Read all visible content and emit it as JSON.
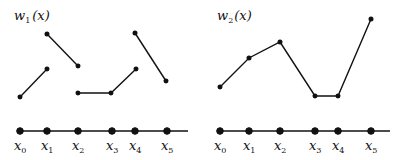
{
  "diagram": {
    "colors": {
      "ink": "#111111",
      "background": "#ffffff"
    },
    "panels": [
      {
        "title": {
          "base": "w",
          "sub": "1",
          "arg": "(x)"
        },
        "ticks": [
          {
            "base": "x",
            "sub": "0"
          },
          {
            "base": "x",
            "sub": "1"
          },
          {
            "base": "x",
            "sub": "2"
          },
          {
            "base": "x",
            "sub": "3"
          },
          {
            "base": "x",
            "sub": "4"
          },
          {
            "base": "x",
            "sub": "5"
          }
        ],
        "description": "piecewise linear discontinuous function",
        "segments": [
          [
            [
              0,
              0.35
            ],
            [
              1,
              0.72
            ]
          ],
          [
            [
              1,
              1.0
            ],
            [
              2,
              0.68
            ]
          ],
          [
            [
              2,
              0.4
            ],
            [
              3,
              0.4
            ],
            [
              4,
              0.72
            ]
          ],
          [
            [
              4,
              1.0
            ],
            [
              5,
              0.55
            ]
          ]
        ]
      },
      {
        "title": {
          "base": "w",
          "sub": "2",
          "arg": "(x)"
        },
        "ticks": [
          {
            "base": "x",
            "sub": "0"
          },
          {
            "base": "x",
            "sub": "1"
          },
          {
            "base": "x",
            "sub": "2"
          },
          {
            "base": "x",
            "sub": "3"
          },
          {
            "base": "x",
            "sub": "4"
          },
          {
            "base": "x",
            "sub": "5"
          }
        ],
        "description": "piecewise linear continuous function",
        "segments": [
          [
            [
              0,
              0.45
            ],
            [
              1,
              0.7
            ],
            [
              2,
              0.84
            ],
            [
              3,
              0.38
            ],
            [
              4,
              0.38
            ],
            [
              5,
              1.0
            ]
          ]
        ]
      }
    ]
  }
}
